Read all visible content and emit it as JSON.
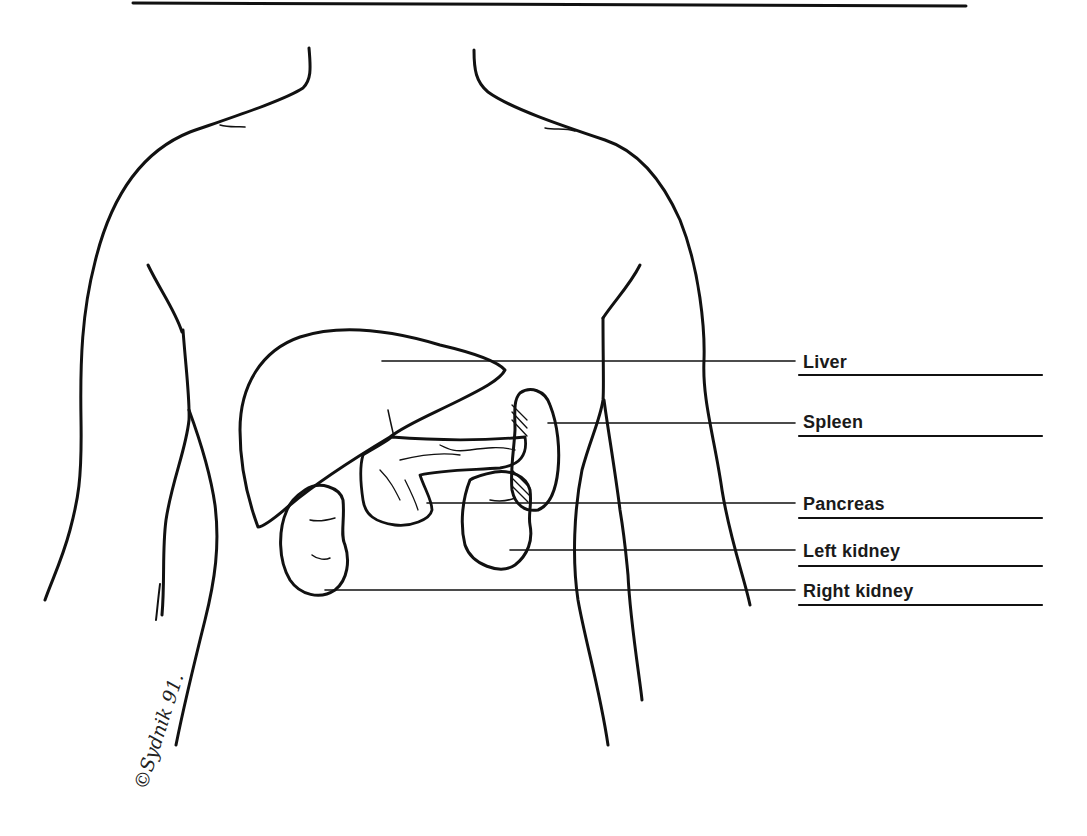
{
  "figure": {
    "type": "anatomical diagram",
    "labels": [
      {
        "id": "liver",
        "text": "Liver",
        "y": 362
      },
      {
        "id": "spleen",
        "text": "Spleen",
        "y": 422
      },
      {
        "id": "pancreas",
        "text": "Pancreas",
        "y": 505
      },
      {
        "id": "left-kidney",
        "text": "Left kidney",
        "y": 551
      },
      {
        "id": "right-kidney",
        "text": "Right kidney",
        "y": 591
      }
    ],
    "signature": "©Sydnik 91."
  }
}
